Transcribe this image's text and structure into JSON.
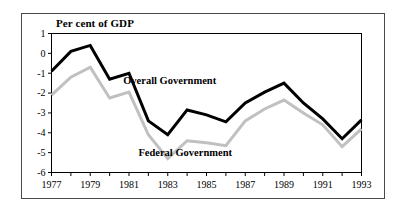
{
  "figure": {
    "title": "Per cent of GDP",
    "frame_color": "#4a4a4a",
    "background": "#ffffff"
  },
  "chart_data": {
    "type": "line",
    "title": "Per cent of GDP",
    "xlabel": "",
    "ylabel": "Per cent of GDP",
    "x": [
      1977,
      1978,
      1979,
      1980,
      1981,
      1982,
      1983,
      1984,
      1985,
      1986,
      1987,
      1988,
      1989,
      1990,
      1991,
      1992,
      1993
    ],
    "xlim": [
      1977,
      1993
    ],
    "ylim": [
      -6,
      1
    ],
    "yticks": [
      1,
      0,
      -1,
      -2,
      -3,
      -4,
      -5,
      -6
    ],
    "ytick_labels": [
      "1",
      "0",
      "-1",
      "-2",
      "-3",
      "-4",
      "-5",
      "-6"
    ],
    "xticks": [
      1977,
      1978,
      1979,
      1980,
      1981,
      1982,
      1983,
      1984,
      1985,
      1986,
      1987,
      1988,
      1989,
      1990,
      1991,
      1992,
      1993
    ],
    "xtick_labels": [
      "1977",
      "",
      "1979",
      "",
      "1981",
      "",
      "1983",
      "",
      "1985",
      "",
      "1987",
      "",
      "1989",
      "",
      "1991",
      "",
      "1993"
    ],
    "xtick_labels_shown": [
      "1977",
      "1979",
      "1981",
      "1983",
      "1985",
      "1987",
      "1989",
      "1991",
      "1993"
    ],
    "grid": false,
    "legend_position": "inline-annotation",
    "series": [
      {
        "name": "Overall Government",
        "color": "#000000",
        "width": 3,
        "label_x": 1983.1,
        "label_y": -1.55,
        "values": [
          -0.9,
          0.1,
          0.4,
          -1.3,
          -1.0,
          -3.4,
          -4.1,
          -2.85,
          -3.1,
          -3.45,
          -2.5,
          -1.95,
          -1.5,
          -2.5,
          -3.3,
          -4.3,
          -3.35
        ]
      },
      {
        "name": "Federal Government",
        "color": "#c0c0c0",
        "width": 3,
        "label_x": 1983.9,
        "label_y": -5.15,
        "values": [
          -2.1,
          -1.2,
          -0.7,
          -2.25,
          -1.95,
          -4.1,
          -5.3,
          -4.4,
          -4.5,
          -4.65,
          -3.4,
          -2.8,
          -2.35,
          -3.0,
          -3.6,
          -4.7,
          -3.8
        ]
      }
    ]
  }
}
